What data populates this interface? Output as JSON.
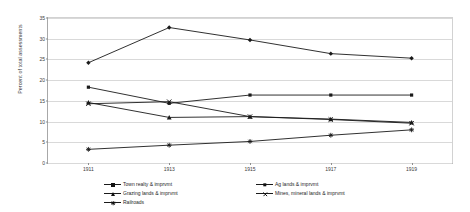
{
  "chart_data": {
    "type": "line",
    "title": "",
    "xlabel": "",
    "ylabel": "Percent of total assessments",
    "categories": [
      "1911",
      "1913",
      "1915",
      "1917",
      "1919"
    ],
    "x": [
      1911,
      1913,
      1915,
      1917,
      1919
    ],
    "ylim": [
      0,
      35
    ],
    "yticks": [
      0,
      5,
      10,
      15,
      20,
      25,
      30,
      35
    ],
    "ytick_labels": [
      "0",
      "5",
      "10",
      "15",
      "20",
      "25",
      "30",
      "35"
    ],
    "grid": true,
    "legend_position": "bottom",
    "series": [
      {
        "name": "Town realty & imprvmt",
        "marker": "diamond",
        "color": "#1a1a1a",
        "values": [
          24.2,
          32.7,
          29.7,
          26.4,
          25.3
        ]
      },
      {
        "name": "Ag lands & imprvmt",
        "marker": "square",
        "color": "#1a1a1a",
        "values": [
          18.3,
          14.4,
          16.4,
          16.4,
          16.4
        ]
      },
      {
        "name": "Grazing lands & imprvmt",
        "marker": "triangle",
        "color": "#1a1a1a",
        "values": [
          14.6,
          11.0,
          11.2,
          10.6,
          9.8
        ]
      },
      {
        "name": "Mines, mineral lands & imprvmt",
        "marker": "x",
        "color": "#1a1a1a",
        "values": [
          14.3,
          14.8,
          11.2,
          10.5,
          9.6
        ]
      },
      {
        "name": "Railroads",
        "marker": "star",
        "color": "#1a1a1a",
        "values": [
          3.3,
          4.3,
          5.2,
          6.7,
          8.0
        ]
      }
    ]
  },
  "axis": {
    "y_title": "Percent of total assessments"
  }
}
